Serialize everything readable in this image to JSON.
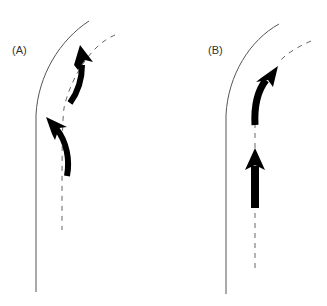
{
  "figure": {
    "panels": [
      {
        "id": "A",
        "label": "(A)",
        "description": "Curved path with two curved arrows following the dashed centerline"
      },
      {
        "id": "B",
        "label": "(B)",
        "description": "Straight arrow then curved arrow along dashed centerline"
      }
    ],
    "colors": {
      "road_edge": "#555555",
      "centerline": "#666666",
      "arrow": "#000000",
      "background": "#ffffff"
    }
  }
}
